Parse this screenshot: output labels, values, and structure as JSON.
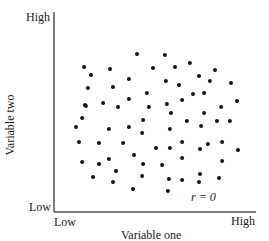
{
  "chart_data": {
    "type": "scatter",
    "title": "",
    "xlabel": "Variable one",
    "ylabel": "Variable two",
    "x_tick_labels": [
      "Low",
      "High"
    ],
    "y_tick_labels": [
      "Low",
      "High"
    ],
    "annotation": "r = 0",
    "xlim": [
      0,
      100
    ],
    "ylim": [
      0,
      100
    ],
    "grid": false,
    "legend": null,
    "points": [
      [
        14.9,
        72.5
      ],
      [
        41.1,
        79.0
      ],
      [
        18.3,
        68.5
      ],
      [
        27.7,
        71.5
      ],
      [
        37.1,
        66.5
      ],
      [
        16.8,
        62.0
      ],
      [
        29.2,
        62.5
      ],
      [
        37.1,
        56.5
      ],
      [
        24.3,
        54.5
      ],
      [
        15.3,
        53.5
      ],
      [
        54.9,
        78.5
      ],
      [
        49.0,
        72.0
      ],
      [
        59.9,
        72.5
      ],
      [
        67.3,
        74.5
      ],
      [
        79.7,
        71.0
      ],
      [
        71.8,
        68.0
      ],
      [
        55.4,
        65.5
      ],
      [
        61.9,
        63.5
      ],
      [
        77.2,
        65.5
      ],
      [
        87.6,
        64.5
      ],
      [
        46.0,
        59.5
      ],
      [
        68.8,
        59.0
      ],
      [
        74.3,
        59.5
      ],
      [
        63.4,
        56.0
      ],
      [
        55.9,
        54.0
      ],
      [
        90.6,
        55.5
      ],
      [
        15.8,
        53.0
      ],
      [
        31.7,
        52.5
      ],
      [
        47.0,
        52.5
      ],
      [
        13.9,
        47.0
      ],
      [
        10.9,
        42.5
      ],
      [
        27.2,
        41.5
      ],
      [
        37.1,
        42.5
      ],
      [
        44.1,
        46.0
      ],
      [
        43.6,
        39.5
      ],
      [
        12.4,
        35.0
      ],
      [
        22.3,
        34.5
      ],
      [
        34.2,
        34.5
      ],
      [
        39.6,
        28.5
      ],
      [
        27.2,
        26.5
      ],
      [
        82.7,
        52.5
      ],
      [
        57.9,
        49.5
      ],
      [
        74.3,
        49.5
      ],
      [
        65.8,
        45.5
      ],
      [
        80.7,
        45.5
      ],
      [
        87.1,
        45.5
      ],
      [
        72.8,
        43.0
      ],
      [
        57.4,
        41.5
      ],
      [
        63.4,
        35.0
      ],
      [
        76.2,
        34.0
      ],
      [
        83.2,
        35.0
      ],
      [
        50.5,
        32.0
      ],
      [
        57.4,
        32.0
      ],
      [
        72.3,
        31.5
      ],
      [
        91.1,
        31.0
      ],
      [
        63.4,
        27.0
      ],
      [
        13.9,
        25.0
      ],
      [
        22.3,
        24.0
      ],
      [
        44.1,
        24.0
      ],
      [
        30.7,
        20.5
      ],
      [
        19.3,
        17.5
      ],
      [
        43.6,
        18.0
      ],
      [
        29.2,
        15.0
      ],
      [
        39.1,
        11.5
      ],
      [
        53.5,
        23.5
      ],
      [
        83.2,
        25.5
      ],
      [
        56.9,
        16.5
      ],
      [
        63.4,
        16.0
      ],
      [
        72.3,
        19.0
      ],
      [
        71.8,
        15.0
      ],
      [
        81.7,
        17.0
      ],
      [
        56.4,
        10.5
      ]
    ]
  },
  "labels": {
    "y_high": "High",
    "y_low": "Low",
    "x_low": "Low",
    "x_high": "High",
    "x_title": "Variable one",
    "y_title": "Variable two",
    "annotation": "r = 0"
  },
  "colors": {
    "axis": "#555555",
    "dot": "#111111",
    "text": "#1a1a1a"
  }
}
